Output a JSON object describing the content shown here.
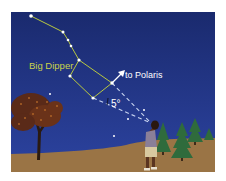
{
  "figure": {
    "labels": {
      "big_dipper": "Big Dipper",
      "to_polaris": "to Polaris",
      "angle": "5°"
    },
    "colors": {
      "sky_top": "#1a2a6e",
      "sky_bottom": "#2a3f9a",
      "ground": "#9a7445",
      "constellation_line": "#b8c840",
      "label_big_dipper": "#c8d24a",
      "guide_line": "#c8d4f0",
      "star": "#ffffff",
      "tree_conifer": "#2f6b3c",
      "tree_deciduous_foliage": "#7a3a1e",
      "person_shirt": "#8a7f98",
      "person_shorts": "#d8c9a0",
      "person_skin": "#5a3420"
    },
    "stars": {
      "big_dipper": [
        {
          "name": "handle-end",
          "x": 20,
          "y": 4
        },
        {
          "name": "handle-2",
          "x": 52,
          "y": 20
        },
        {
          "name": "handle-3",
          "x": 57,
          "y": 28
        },
        {
          "name": "handle-4",
          "x": 60,
          "y": 34
        },
        {
          "name": "bowl-top-left",
          "x": 68,
          "y": 48
        },
        {
          "name": "bowl-bottom-left",
          "x": 59,
          "y": 64
        },
        {
          "name": "bowl-bottom-right",
          "x": 82,
          "y": 86
        },
        {
          "name": "bowl-top-right",
          "x": 101,
          "y": 71
        }
      ],
      "background": [
        {
          "x": 39,
          "y": 82
        },
        {
          "x": 133,
          "y": 98
        },
        {
          "x": 117,
          "y": 107
        },
        {
          "x": 103,
          "y": 124
        }
      ]
    }
  }
}
